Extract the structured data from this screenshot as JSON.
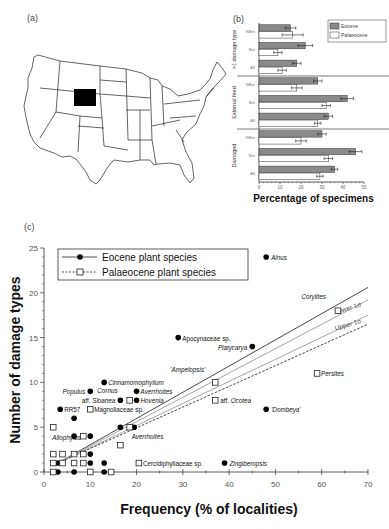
{
  "panels": {
    "a": {
      "label": "(a)"
    },
    "b": {
      "label": "(b)"
    },
    "c": {
      "label": "(c)"
    }
  },
  "map": {
    "description": "Outline map of contiguous United States with Wyoming highlighted",
    "highlighted_state": "Wyoming",
    "highlight_color": "#000000"
  },
  "chart_data": [
    {
      "id": "b",
      "type": "bar",
      "orientation": "horizontal",
      "title": "",
      "xlabel": "Percentage of specimens",
      "ylabel": "",
      "xlim": [
        0,
        50
      ],
      "xticks": [
        "0",
        "10",
        "20",
        "30",
        "40",
        "50"
      ],
      "legend": {
        "position": "top-right",
        "entries": [
          "Eocene",
          "Palaeocene"
        ]
      },
      "colors": {
        "Eocene": "#8a8a8a",
        "Palaeocene": "#ffffff"
      },
      "groups": [
        {
          "name": ">1 damage type",
          "categories": [
            "NBet",
            "Bet",
            "All"
          ],
          "series": [
            {
              "name": "Eocene",
              "values": [
                15,
                22,
                18
              ],
              "errors": [
                2.5,
                3.5,
                2
              ]
            },
            {
              "name": "Palaeocene",
              "values": [
                16,
                9,
                11
              ],
              "errors": [
                5,
                2,
                2
              ]
            }
          ]
        },
        {
          "name": "External feed",
          "categories": [
            "NBet",
            "Bet",
            "All"
          ],
          "series": [
            {
              "name": "Eocene",
              "values": [
                28,
                42,
                33
              ],
              "errors": [
                2,
                3,
                2
              ]
            },
            {
              "name": "Palaeocene",
              "values": [
                18,
                32,
                28
              ],
              "errors": [
                2.5,
                2,
                1.5
              ]
            }
          ]
        },
        {
          "name": "Damaged",
          "categories": [
            "NBet",
            "Bet",
            "All"
          ],
          "series": [
            {
              "name": "Eocene",
              "values": [
                30,
                46,
                36
              ],
              "errors": [
                2,
                3,
                1.5
              ]
            },
            {
              "name": "Palaeocene",
              "values": [
                20,
                33,
                29
              ],
              "errors": [
                2.5,
                2,
                1.5
              ]
            }
          ]
        }
      ]
    },
    {
      "id": "c",
      "type": "scatter",
      "title": "",
      "xlabel": "Frequency (% of localities)",
      "ylabel": "Number of damage types",
      "xlim": [
        0,
        70
      ],
      "ylim": [
        0,
        25
      ],
      "xticks": [
        "0",
        "10",
        "20",
        "30",
        "40",
        "50",
        "60",
        "70"
      ],
      "yticks": [
        "0",
        "5",
        "10",
        "15",
        "20",
        "25"
      ],
      "legend": {
        "position": "top-left",
        "entries": [
          "Eocene plant species",
          "Palaeocene plant species"
        ]
      },
      "series": [
        {
          "name": "Eocene plant species",
          "marker": "filled-circle",
          "points": [
            {
              "x": 48,
              "y": 24,
              "label": "Alnus"
            },
            {
              "x": 29,
              "y": 15,
              "label": "Apocynaceae sp."
            },
            {
              "x": 45,
              "y": 14,
              "label": "Platycarya"
            },
            {
              "x": 13,
              "y": 10,
              "label": "Cinnamomophyllum"
            },
            {
              "x": 10,
              "y": 9,
              "label": "Populus"
            },
            {
              "x": 20,
              "y": 9,
              "label": "Averrhoites"
            },
            {
              "x": 16.5,
              "y": 8,
              "label": "aff. Sloanea"
            },
            {
              "x": 20,
              "y": 8,
              "label": "Hovenia"
            },
            {
              "x": 3.5,
              "y": 7,
              "label": "RR57"
            },
            {
              "x": 48,
              "y": 7,
              "label": "'Dombeya'"
            },
            {
              "x": 39,
              "y": 1,
              "label": "Zingiberopsis"
            },
            {
              "x": 6.5,
              "y": 6,
              "label": ""
            },
            {
              "x": 6.5,
              "y": 4,
              "label": ""
            },
            {
              "x": 10,
              "y": 4,
              "label": ""
            },
            {
              "x": 16.5,
              "y": 5,
              "label": ""
            },
            {
              "x": 19.5,
              "y": 5,
              "label": ""
            },
            {
              "x": 10,
              "y": 2,
              "label": ""
            },
            {
              "x": 3,
              "y": 1,
              "label": ""
            },
            {
              "x": 6.5,
              "y": 1,
              "label": ""
            },
            {
              "x": 10,
              "y": 1,
              "label": ""
            },
            {
              "x": 13,
              "y": 1,
              "label": ""
            },
            {
              "x": 3,
              "y": 0,
              "label": ""
            },
            {
              "x": 6.5,
              "y": 0,
              "label": ""
            },
            {
              "x": 13,
              "y": 0,
              "label": ""
            }
          ]
        },
        {
          "name": "Palaeocene plant species",
          "marker": "open-square",
          "points": [
            {
              "x": 63.5,
              "y": 18,
              "label": "Corylites"
            },
            {
              "x": 37,
              "y": 10,
              "label": "'Ampelopsis'"
            },
            {
              "x": 59,
              "y": 11,
              "label": "Persites"
            },
            {
              "x": 37,
              "y": 8,
              "label": "aff. Ocotea"
            },
            {
              "x": 18.5,
              "y": 8,
              "label": "Cornus"
            },
            {
              "x": 10,
              "y": 7,
              "label": "Magnoliaceae sp."
            },
            {
              "x": 18.5,
              "y": 5,
              "label": "Averrhoites"
            },
            {
              "x": 2,
              "y": 5,
              "label": "Allophylus"
            },
            {
              "x": 20.5,
              "y": 1,
              "label": "Cercidiphyllaceae sp."
            },
            {
              "x": 8.5,
              "y": 4,
              "label": ""
            },
            {
              "x": 16.5,
              "y": 3,
              "label": ""
            },
            {
              "x": 2,
              "y": 2,
              "label": ""
            },
            {
              "x": 4,
              "y": 2,
              "label": ""
            },
            {
              "x": 6.5,
              "y": 2,
              "label": ""
            },
            {
              "x": 8.5,
              "y": 2,
              "label": ""
            },
            {
              "x": 2,
              "y": 1,
              "label": ""
            },
            {
              "x": 4,
              "y": 1,
              "label": ""
            },
            {
              "x": 6.5,
              "y": 1,
              "label": ""
            },
            {
              "x": 8.5,
              "y": 1,
              "label": ""
            },
            {
              "x": 2,
              "y": 0,
              "label": ""
            },
            {
              "x": 10,
              "y": 0,
              "label": ""
            },
            {
              "x": 14.5,
              "y": 0,
              "label": ""
            }
          ]
        }
      ],
      "lines": [
        {
          "name": "Eocene regression",
          "style": "solid",
          "color": "#333333",
          "from": [
            3,
            1
          ],
          "to": [
            70,
            20.6
          ]
        },
        {
          "name": "Lower 1σ",
          "style": "solid",
          "color": "#999999",
          "from": [
            3,
            1
          ],
          "to": [
            70,
            19.2
          ]
        },
        {
          "name": "Upper 1σ",
          "style": "solid",
          "color": "#999999",
          "from": [
            3,
            1
          ],
          "to": [
            70,
            17.5
          ]
        },
        {
          "name": "Palaeocene regression",
          "style": "dashed",
          "color": "#333333",
          "from": [
            3,
            1
          ],
          "to": [
            70,
            16.5
          ]
        }
      ],
      "annotations": [
        "Lower 1σ",
        "Upper 1σ"
      ]
    }
  ]
}
